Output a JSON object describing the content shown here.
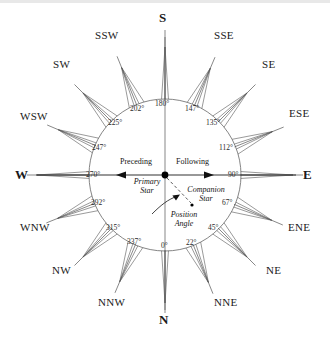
{
  "figure": {
    "center_x": 165,
    "center_y": 175,
    "circle_radius": 76,
    "stroke_color": "#555555",
    "text_color": "#1a1a1a"
  },
  "compass": {
    "directions": [
      {
        "name": "S",
        "cardinal": true,
        "angle_deg": 180,
        "x": 165,
        "y": 18
      },
      {
        "name": "SSE",
        "cardinal": false,
        "angle_deg": 157,
        "x": 229,
        "y": 35
      },
      {
        "name": "SE",
        "cardinal": false,
        "angle_deg": 135,
        "x": 271,
        "y": 65
      },
      {
        "name": "ESE",
        "cardinal": false,
        "angle_deg": 112,
        "x": 296,
        "y": 114
      },
      {
        "name": "E",
        "cardinal": true,
        "angle_deg": 90,
        "x": 309,
        "y": 175
      },
      {
        "name": "ENE",
        "cardinal": false,
        "angle_deg": 67,
        "x": 296,
        "y": 228
      },
      {
        "name": "NE",
        "cardinal": false,
        "angle_deg": 45,
        "x": 272,
        "y": 271
      },
      {
        "name": "NNE",
        "cardinal": false,
        "angle_deg": 22,
        "x": 228,
        "y": 303
      },
      {
        "name": "N",
        "cardinal": true,
        "angle_deg": 0,
        "x": 165,
        "y": 320
      },
      {
        "name": "NNW",
        "cardinal": false,
        "angle_deg": 337,
        "x": 102,
        "y": 303
      },
      {
        "name": "NW",
        "cardinal": false,
        "angle_deg": 315,
        "x": 58,
        "y": 271
      },
      {
        "name": "WNW",
        "cardinal": false,
        "angle_deg": 292,
        "x": 34,
        "y": 228
      },
      {
        "name": "W",
        "cardinal": true,
        "angle_deg": 270,
        "x": 20,
        "y": 175
      },
      {
        "name": "WSW",
        "cardinal": false,
        "angle_deg": 247,
        "x": 34,
        "y": 117
      },
      {
        "name": "SW",
        "cardinal": false,
        "angle_deg": 225,
        "x": 60,
        "y": 65
      },
      {
        "name": "SSW",
        "cardinal": false,
        "angle_deg": 202,
        "x": 105,
        "y": 36
      }
    ],
    "degree_labels": [
      {
        "text": "180°",
        "angle_deg": 180,
        "x": 165,
        "y": 105
      },
      {
        "text": "147°",
        "angle_deg": 157,
        "x": 194,
        "y": 110
      },
      {
        "text": "135°",
        "angle_deg": 135,
        "x": 215,
        "y": 124
      },
      {
        "text": "112°",
        "angle_deg": 112,
        "x": 228,
        "y": 149
      },
      {
        "text": "90°",
        "angle_deg": 90,
        "x": 234,
        "y": 176
      },
      {
        "text": "67°",
        "angle_deg": 67,
        "x": 228,
        "y": 204
      },
      {
        "text": "45°",
        "angle_deg": 45,
        "x": 215,
        "y": 229
      },
      {
        "text": "22°",
        "angle_deg": 22,
        "x": 192,
        "y": 244
      },
      {
        "text": "0°",
        "angle_deg": 0,
        "x": 165,
        "y": 247
      },
      {
        "text": "337°",
        "angle_deg": 337,
        "x": 137,
        "y": 243
      },
      {
        "text": "315°",
        "angle_deg": 315,
        "x": 116,
        "y": 229
      },
      {
        "text": "292°",
        "angle_deg": 292,
        "x": 101,
        "y": 204
      },
      {
        "text": "270°",
        "angle_deg": 270,
        "x": 96,
        "y": 176
      },
      {
        "text": "247°",
        "angle_deg": 247,
        "x": 101,
        "y": 149
      },
      {
        "text": "225°",
        "angle_deg": 225,
        "x": 117,
        "y": 124
      },
      {
        "text": "202°",
        "angle_deg": 202,
        "x": 139,
        "y": 110
      }
    ]
  },
  "annotations": {
    "preceding": {
      "text": "Preceding",
      "x": 147,
      "y": 163
    },
    "following": {
      "text": "Following",
      "x": 188,
      "y": 163
    },
    "primary_star": {
      "line1": "Primary",
      "line2": "Star",
      "x": 147,
      "y": 183
    },
    "companion_star": {
      "line1": "Companion",
      "line2": "Star",
      "x": 193,
      "y": 188
    },
    "position_angle": {
      "line1": "Position",
      "line2": "Angle",
      "x": 178,
      "y": 215
    }
  },
  "markers": {
    "primary_star_point": {
      "x": 165,
      "y": 175,
      "r": 3.4
    },
    "companion_star_point": {
      "x": 192,
      "y": 205,
      "r": 1.6
    }
  }
}
